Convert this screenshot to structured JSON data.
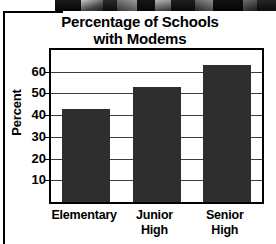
{
  "chart_data": {
    "type": "bar",
    "title": "Percentage of Schools with Modems",
    "title_line1": "Percentage of Schools",
    "title_line2": "with Modems",
    "xlabel": "",
    "ylabel": "Percent",
    "categories": [
      "Elementary",
      "Junior High",
      "Senior High"
    ],
    "category_lines": [
      [
        "Elementary"
      ],
      [
        "Junior",
        "High"
      ],
      [
        "Senior",
        "High"
      ]
    ],
    "values": [
      43,
      53,
      63
    ],
    "ylim": [
      0,
      70
    ],
    "yticks": [
      10,
      20,
      30,
      40,
      50,
      60
    ],
    "ytick_labels": [
      "10",
      "20",
      "30",
      "40",
      "50",
      "60"
    ],
    "grid": true,
    "legend": false,
    "bar_color": "#2e2e2e",
    "axis_color": "#000000",
    "gridline_color": "#3d3d3d",
    "background_color": "#ffffff"
  }
}
